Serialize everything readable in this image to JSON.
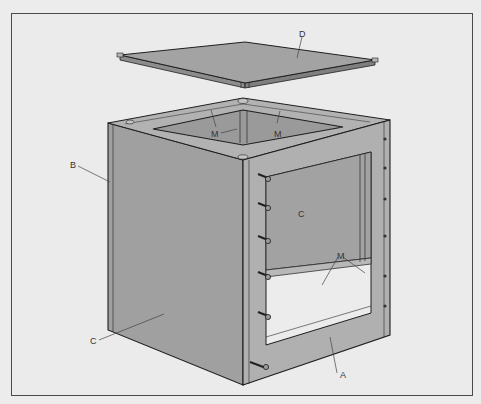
{
  "figure": {
    "type": "exploded isometric technical illustration",
    "colors": {
      "background": "#ebebeb",
      "panel_fill": "#a3a3a3",
      "panel_dark": "#8f8f8f",
      "frame_fill": "#b0b0b0",
      "outline": "#1e1e1e",
      "leader": "#444444"
    }
  },
  "labels": {
    "top_panel": "D",
    "left_edge": "B",
    "front_left_side": "C",
    "interior_back_panel": "C",
    "inner_frame_left": "M",
    "inner_frame_right": "M",
    "front_frame_rails": "M",
    "front_frame": "A"
  },
  "callouts": [
    {
      "letter": "D",
      "part": "top panel (lid)"
    },
    {
      "letter": "B",
      "part": "side panel edge"
    },
    {
      "letter": "C",
      "part": "side panel"
    },
    {
      "letter": "C",
      "part": "back panel (visible through opening)"
    },
    {
      "letter": "M",
      "part": "inner corner frame members"
    },
    {
      "letter": "A",
      "part": "front face frame"
    }
  ],
  "bolts": {
    "count": 6,
    "side": "front-left stile"
  },
  "holes": {
    "count": 6,
    "side": "front-right stile"
  }
}
